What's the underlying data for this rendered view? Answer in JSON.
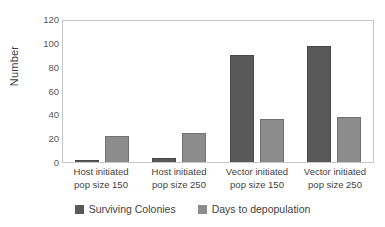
{
  "chart_data": {
    "type": "bar",
    "title": "",
    "subtitle": "",
    "xlabel": "",
    "ylabel": "Number",
    "ylim": [
      0,
      120
    ],
    "ytick_step": 20,
    "yticks": [
      "0",
      "20",
      "40",
      "60",
      "80",
      "100",
      "120"
    ],
    "grid": false,
    "legend_position": "bottom",
    "categories": [
      "Host initiated pop size 150",
      "Host initiated pop size 250",
      "Vector initiated pop size 150",
      "Vector initiated pop size 250"
    ],
    "category_lines": [
      [
        "Host initiated",
        "pop size 150"
      ],
      [
        "Host initiated",
        "pop size 250"
      ],
      [
        "Vector initiated",
        "pop size 150"
      ],
      [
        "Vector initiated",
        "pop size 250"
      ]
    ],
    "series": [
      {
        "name": "Surviving Colonies",
        "color": "#595959",
        "values": [
          1,
          3,
          90,
          97
        ]
      },
      {
        "name": "Days to depopulation",
        "color": "#8c8c8c",
        "values": [
          22,
          24,
          36,
          38
        ]
      }
    ]
  },
  "axis": {
    "y_title": "Number"
  },
  "legend": {
    "items": [
      {
        "label": "Surviving Colonies",
        "color": "#595959"
      },
      {
        "label": "Days to depopulation",
        "color": "#8c8c8c"
      }
    ]
  },
  "colors": {
    "series_dark": "#595959",
    "series_light": "#8c8c8c",
    "plot_border": "#c8c8c8",
    "text": "#3f3f3f",
    "tick_text": "#595959",
    "background": "#ffffff"
  }
}
